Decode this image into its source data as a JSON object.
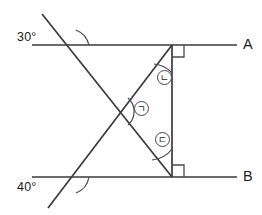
{
  "figure": {
    "type": "geometry-diagram",
    "background_color": "#ffffff",
    "line_color": "#3a3a3f",
    "text_color": "#1d1d21"
  },
  "angles": {
    "top_left": "30°",
    "bottom_left": "40°"
  },
  "line_labels": {
    "top_line": "A",
    "bottom_line": "B"
  },
  "marked_angles": [
    {
      "id": "angle-nieun",
      "label": "ㄴ",
      "position": "upper-right",
      "vertex": "top"
    },
    {
      "id": "angle-giyeok",
      "label": "ㄱ",
      "position": "center",
      "vertex": "intersection"
    },
    {
      "id": "angle-digeut",
      "label": "ㄷ",
      "position": "lower-right",
      "vertex": "bottom"
    }
  ],
  "right_angles": [
    {
      "id": "right-angle-top",
      "vertex": "top-right",
      "value": "90°"
    },
    {
      "id": "right-angle-bottom",
      "vertex": "bottom-right",
      "value": "90°"
    }
  ]
}
